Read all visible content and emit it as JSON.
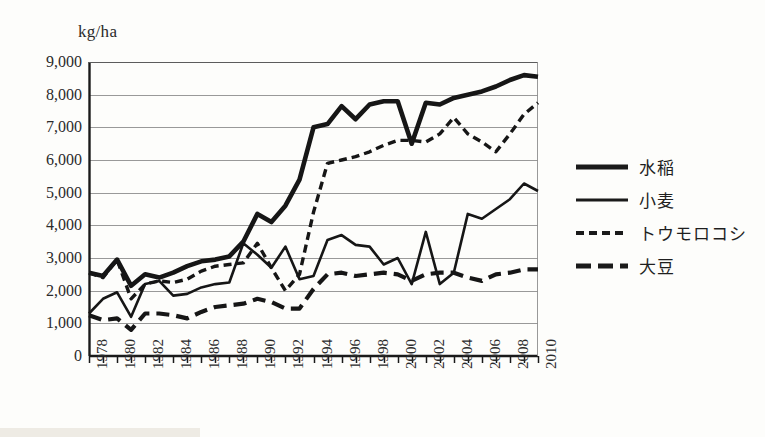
{
  "axis": {
    "unit_label": "kg/ha",
    "y_ticks": [
      "9,000",
      "8,000",
      "7,000",
      "6,000",
      "5,000",
      "4,000",
      "3,000",
      "2,000",
      "1,000",
      "0"
    ],
    "x_ticks": [
      "1978",
      "1980",
      "1982",
      "1984",
      "1986",
      "1988",
      "1990",
      "1992",
      "1994",
      "1996",
      "1998",
      "2000",
      "2002",
      "2004",
      "2006",
      "2008",
      "2010"
    ]
  },
  "legend": {
    "items": [
      {
        "label": "水稲",
        "style": "thick-solid"
      },
      {
        "label": "小麦",
        "style": "thin-solid"
      },
      {
        "label": "トウモロコシ",
        "style": "short-dash"
      },
      {
        "label": "大豆",
        "style": "long-dash"
      }
    ]
  },
  "chart_data": {
    "type": "line",
    "title": "",
    "xlabel": "",
    "ylabel": "kg/ha",
    "ylim": [
      0,
      9000
    ],
    "xlim": [
      1978,
      2010
    ],
    "ytick_step": 1000,
    "grid": true,
    "legend_position": "right",
    "x": [
      1978,
      1979,
      1980,
      1981,
      1982,
      1983,
      1984,
      1985,
      1986,
      1987,
      1988,
      1989,
      1990,
      1991,
      1992,
      1993,
      1994,
      1995,
      1996,
      1997,
      1998,
      1999,
      2000,
      2001,
      2002,
      2003,
      2004,
      2005,
      2006,
      2007,
      2008,
      2009,
      2010
    ],
    "series": [
      {
        "name": "水稲",
        "style": "thick-solid",
        "values": [
          2550,
          2450,
          2950,
          2150,
          2500,
          2400,
          2550,
          2750,
          2900,
          2950,
          3050,
          3500,
          4350,
          4100,
          4600,
          5400,
          7000,
          7100,
          7650,
          7250,
          7700,
          7800,
          7800,
          6500,
          7750,
          7700,
          7900,
          8000,
          8100,
          8250,
          8450,
          8600,
          8550
        ]
      },
      {
        "name": "小麦",
        "style": "thin-solid",
        "values": [
          1300,
          1750,
          1950,
          1200,
          2200,
          2300,
          1850,
          1900,
          2100,
          2200,
          2250,
          3450,
          3100,
          2700,
          3350,
          2350,
          2450,
          3550,
          3700,
          3400,
          3350,
          2800,
          3000,
          2200,
          3800,
          2200,
          2550,
          4350,
          4200,
          4500,
          4800,
          5280,
          5050
        ]
      },
      {
        "name": "トウモロコシ",
        "style": "short-dash",
        "values": [
          2550,
          2400,
          2950,
          1750,
          2200,
          2300,
          2250,
          2350,
          2600,
          2750,
          2800,
          2850,
          3450,
          2700,
          2000,
          2500,
          4400,
          5900,
          6000,
          6100,
          6250,
          6450,
          6600,
          6600,
          6550,
          6800,
          7300,
          6800,
          6550,
          6250,
          6800,
          7400,
          7750
        ]
      },
      {
        "name": "大豆",
        "style": "long-dash",
        "values": [
          1250,
          1100,
          1150,
          800,
          1300,
          1300,
          1250,
          1150,
          1350,
          1500,
          1550,
          1600,
          1750,
          1650,
          1450,
          1450,
          2050,
          2500,
          2550,
          2450,
          2500,
          2550,
          2500,
          2300,
          2500,
          2550,
          2550,
          2400,
          2300,
          2500,
          2550,
          2650,
          2650
        ]
      }
    ]
  }
}
